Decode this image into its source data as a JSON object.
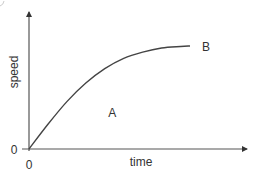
{
  "chart_data": {
    "type": "line",
    "title": "",
    "xlabel": "time",
    "ylabel": "speed",
    "x_origin_label": "0",
    "y_origin_label": "0",
    "curve_description": "speed rises from 0, increasing quickly then levelling off to a plateau",
    "series": [
      {
        "name": "speed-time curve",
        "points": [
          [
            0,
            0
          ],
          [
            0.1,
            0.24
          ],
          [
            0.2,
            0.46
          ],
          [
            0.3,
            0.64
          ],
          [
            0.4,
            0.78
          ],
          [
            0.5,
            0.88
          ],
          [
            0.6,
            0.94
          ],
          [
            0.7,
            0.98
          ],
          [
            0.8,
            0.995
          ],
          [
            0.85,
            1.0
          ]
        ]
      }
    ],
    "xlim": [
      0,
      1
    ],
    "ylim": [
      0,
      1.35
    ],
    "annotations": [
      {
        "text": "A",
        "meaning": "area under curve",
        "x": 0.44,
        "y": 0.35
      },
      {
        "text": "B",
        "meaning": "end of curve",
        "x": 0.9,
        "y": 1.0
      }
    ],
    "grid": false,
    "legend": "none"
  },
  "colors": {
    "axis": "#555555",
    "curve": "#444444",
    "text": "#333333"
  }
}
